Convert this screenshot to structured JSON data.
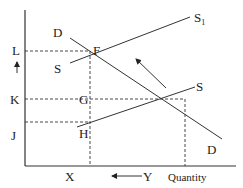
{
  "diagram": {
    "type": "supply-demand",
    "axes": {
      "x_label": "Quantity",
      "y_label": ""
    },
    "price_levels": [
      "L",
      "K",
      "J"
    ],
    "quantity_levels": [
      "X",
      "Y"
    ],
    "curves": {
      "demand": "D",
      "demand_end": "D",
      "supply_original": "S",
      "supply_original_end": "S",
      "supply_shifted": "S",
      "supply_shifted_subscript": "1"
    },
    "points": {
      "f": "F",
      "g": "G",
      "h": "H"
    },
    "arrows": {
      "price_arrow": "up",
      "quantity_arrow": "left",
      "supply_shift_arrow": "up-left"
    }
  }
}
